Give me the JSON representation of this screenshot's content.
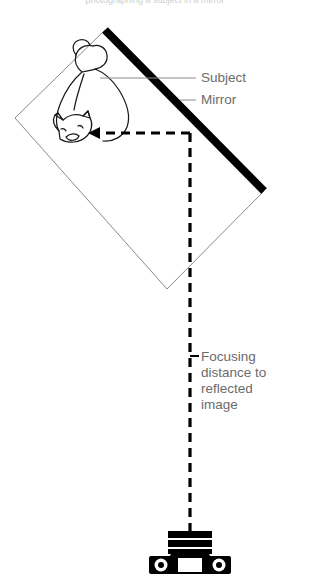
{
  "figure": {
    "title_cropped": "photographing a subject in a mirror",
    "background_color": "#ffffff",
    "ink_color": "#000000",
    "text_color": "#6b6b6b",
    "thin_line_color": "#8a8a8a"
  },
  "labels": {
    "subject": "Subject",
    "mirror": "Mirror",
    "focusing_distance": {
      "lines": [
        "Focusing",
        "distance to",
        "reflected",
        "image"
      ],
      "full": "Focusing distance to reflected image"
    }
  },
  "elements": {
    "mirror": {
      "name": "mirror",
      "kind": "thick-line",
      "color": "#000000",
      "thickness_px": 8,
      "from": [
        105,
        30
      ],
      "to": [
        264,
        191
      ]
    },
    "virtual_image_box": {
      "name": "reflected-image-frame",
      "kind": "thin-quadrilateral",
      "color": "#8a8a8a",
      "points": [
        [
          105,
          30
        ],
        [
          15,
          118
        ],
        [
          167,
          289
        ],
        [
          264,
          191
        ]
      ]
    },
    "subject": {
      "name": "cat-subject",
      "kind": "outline-drawing",
      "description": "cat seen from above, head lower-left, tail upper-right"
    },
    "light_path_horizontal": {
      "name": "reflected-ray",
      "kind": "dashed-arrow",
      "direction": "left",
      "from": [
        190,
        133
      ],
      "to": [
        92,
        133
      ]
    },
    "light_path_vertical": {
      "name": "focus-distance-line",
      "kind": "dashed-line",
      "from": [
        190,
        133
      ],
      "to": [
        190,
        532
      ]
    },
    "distance_tick": {
      "name": "distance-tick",
      "kind": "tick",
      "at": [
        190,
        356
      ]
    },
    "camera": {
      "name": "camera",
      "kind": "silhouette",
      "view": "top-down",
      "center": [
        190,
        552
      ]
    }
  },
  "leaders": [
    {
      "name": "subject-leader",
      "from": [
        100,
        78
      ],
      "to": [
        196,
        78
      ]
    },
    {
      "name": "mirror-leader",
      "from": [
        180,
        100
      ],
      "to": [
        196,
        100
      ]
    }
  ]
}
